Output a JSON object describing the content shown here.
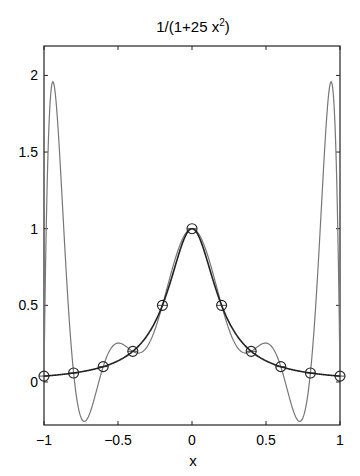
{
  "chart_data": {
    "type": "line",
    "title_main": "1/(1+25 x",
    "title_sup": "2",
    "title_close": ")",
    "xlabel": "x",
    "ylabel": "",
    "xlim": [
      -1,
      1
    ],
    "ylim": [
      -0.28,
      2.19
    ],
    "xticks": [
      -1,
      -0.5,
      0,
      0.5,
      1
    ],
    "xtick_labels": [
      "−1",
      "−0.5",
      "0",
      "0.5",
      "1"
    ],
    "yticks": [
      0,
      0.5,
      1,
      1.5,
      2
    ],
    "ytick_labels": [
      "0",
      "0.5",
      "1",
      "1.5",
      "2"
    ],
    "grid": false,
    "legend": null,
    "series": [
      {
        "name": "f(x) = 1/(1+25x^2)",
        "style": "solid dark line",
        "color": "#222222",
        "x": [
          -1,
          -0.8,
          -0.6,
          -0.4,
          -0.2,
          0,
          0.2,
          0.4,
          0.6,
          0.8,
          1
        ],
        "values": [
          0.0385,
          0.0588,
          0.1,
          0.2,
          0.5,
          1.0,
          0.5,
          0.2,
          0.1,
          0.0588,
          0.0385
        ]
      },
      {
        "name": "degree-10 interpolating polynomial",
        "style": "thin gray line",
        "color": "#777777",
        "x": [
          -0.94,
          -0.73,
          -0.5,
          0,
          0.5,
          0.73,
          0.94
        ],
        "values": [
          1.96,
          -0.24,
          0.25,
          1.0,
          0.25,
          -0.24,
          1.96
        ]
      },
      {
        "name": "interpolation nodes",
        "style": "open circle markers",
        "color": "#222222",
        "x": [
          -1,
          -0.8,
          -0.6,
          -0.4,
          -0.2,
          0,
          0.2,
          0.4,
          0.6,
          0.8,
          1
        ],
        "values": [
          0.0385,
          0.0588,
          0.1,
          0.2,
          0.5,
          1.0,
          0.5,
          0.2,
          0.1,
          0.0588,
          0.0385
        ]
      }
    ]
  },
  "layout": {
    "plot_left": 44,
    "plot_right": 340,
    "plot_top": 46,
    "plot_bottom": 425,
    "y_zero_px": 382,
    "y_unit_px": 153.3
  }
}
